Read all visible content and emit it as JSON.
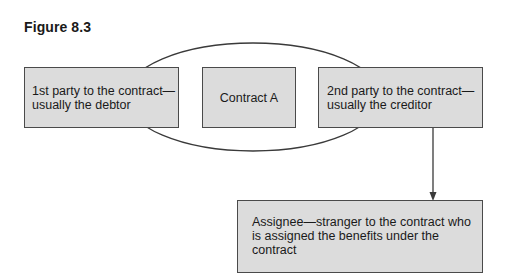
{
  "figure": {
    "title": "Figure 8.3"
  },
  "diagram": {
    "ellipse_label": "",
    "nodes": [
      {
        "id": "first_party",
        "line1": "1st party to the contract—",
        "line2": "usually the debtor"
      },
      {
        "id": "contract",
        "label": "Contract A"
      },
      {
        "id": "second_party",
        "line1": "2nd party to the contract—",
        "line2": "usually the creditor"
      },
      {
        "id": "assignee",
        "line1": "Assignee—stranger to the contract who",
        "line2": "is assigned the benefits under the",
        "line3": "contract"
      }
    ],
    "edges": [
      {
        "from": "second_party",
        "to": "assignee",
        "type": "arrow"
      }
    ],
    "colors": {
      "box_fill": "#dcdcdc",
      "box_border": "#4a4a4a",
      "line": "#3a3a3a"
    }
  }
}
